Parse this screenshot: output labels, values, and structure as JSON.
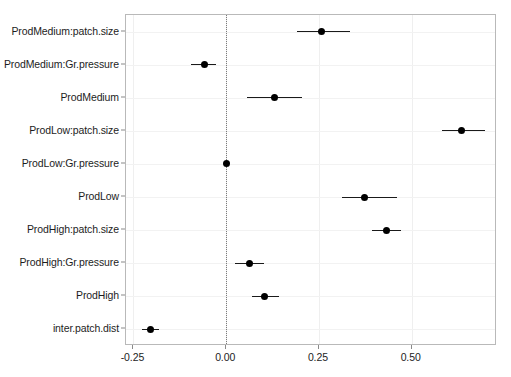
{
  "chart_data": {
    "type": "scatter",
    "subtype": "forest-plot",
    "title": "",
    "xlabel": "",
    "ylabel": "",
    "xlim": [
      -0.27,
      0.73
    ],
    "xticks": [
      -0.25,
      0.0,
      0.25,
      0.5
    ],
    "xtick_labels": [
      "-0.25",
      "0.00",
      "0.25",
      "0.50"
    ],
    "grid": true,
    "legend": "none",
    "reference_line": {
      "value": 0.0,
      "style": "dotted",
      "color": "#7b7b7b"
    },
    "point_color": "#000000",
    "errorbar_color": "#1a1a1a",
    "categories": [
      "ProdMedium:patch.size",
      "ProdMedium:Gr.pressure",
      "ProdMedium",
      "ProdLow:patch.size",
      "ProdLow:Gr.pressure",
      "ProdLow",
      "ProdHigh:patch.size",
      "ProdHigh:Gr.pressure",
      "ProdHigh",
      "inter.patch.dist"
    ],
    "estimates": [
      0.258,
      -0.059,
      0.129,
      0.634,
      0.0,
      0.374,
      0.433,
      0.062,
      0.103,
      -0.205
    ],
    "ci_low": [
      0.191,
      -0.094,
      0.057,
      0.581,
      -0.004,
      0.313,
      0.393,
      0.024,
      0.07,
      -0.227
    ],
    "ci_high": [
      0.333,
      -0.027,
      0.205,
      0.697,
      0.004,
      0.461,
      0.47,
      0.102,
      0.143,
      -0.182
    ],
    "points": [
      {
        "label": "ProdMedium:patch.size",
        "estimate": 0.258,
        "ci_low": 0.191,
        "ci_high": 0.333
      },
      {
        "label": "ProdMedium:Gr.pressure",
        "estimate": -0.059,
        "ci_low": -0.094,
        "ci_high": -0.027
      },
      {
        "label": "ProdMedium",
        "estimate": 0.129,
        "ci_low": 0.057,
        "ci_high": 0.205
      },
      {
        "label": "ProdLow:patch.size",
        "estimate": 0.634,
        "ci_low": 0.581,
        "ci_high": 0.697
      },
      {
        "label": "ProdLow:Gr.pressure",
        "estimate": 0.0,
        "ci_low": -0.004,
        "ci_high": 0.004
      },
      {
        "label": "ProdLow",
        "estimate": 0.374,
        "ci_low": 0.313,
        "ci_high": 0.461
      },
      {
        "label": "ProdHigh:patch.size",
        "estimate": 0.433,
        "ci_low": 0.393,
        "ci_high": 0.47
      },
      {
        "label": "ProdHigh:Gr.pressure",
        "estimate": 0.062,
        "ci_low": 0.024,
        "ci_high": 0.102
      },
      {
        "label": "ProdHigh",
        "estimate": 0.103,
        "ci_low": 0.07,
        "ci_high": 0.143
      },
      {
        "label": "inter.patch.dist",
        "estimate": -0.205,
        "ci_low": -0.227,
        "ci_high": -0.182
      }
    ]
  }
}
